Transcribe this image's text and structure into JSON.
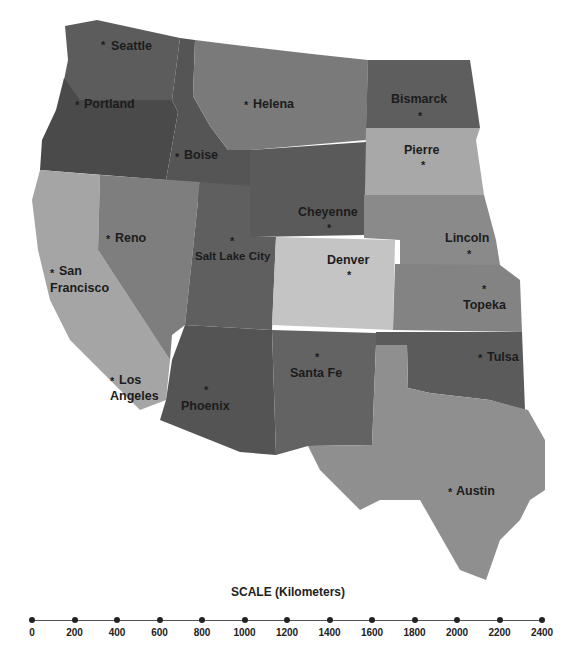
{
  "map": {
    "type": "choropleth-style reference map (grayscale)",
    "region": "Western United States",
    "colors": {
      "washington": "#5c5c5c",
      "oregon": "#4a4a4a",
      "idaho": "#555555",
      "montana": "#7a7a7a",
      "north_dakota": "#5e5e5e",
      "south_dakota": "#a8a8a8",
      "wyoming": "#5a5a5a",
      "nebraska": "#8a8a8a",
      "california": "#a5a5a5",
      "nevada": "#7e7e7e",
      "utah": "#5f5f5f",
      "colorado": "#c4c4c4",
      "kansas": "#838383",
      "arizona": "#545454",
      "new_mexico": "#636363",
      "oklahoma": "#5b5b5b",
      "texas": "#8f8f8f"
    },
    "cities": [
      {
        "name": "Seattle"
      },
      {
        "name": "Portland"
      },
      {
        "name": "Helena"
      },
      {
        "name": "Bismarck"
      },
      {
        "name": "Boise"
      },
      {
        "name": "Pierre"
      },
      {
        "name": "Cheyenne"
      },
      {
        "name": "Reno"
      },
      {
        "name": "Salt Lake City"
      },
      {
        "name": "Lincoln"
      },
      {
        "name": "San"
      },
      {
        "name": "Francisco"
      },
      {
        "name": "Denver"
      },
      {
        "name": "Topeka"
      },
      {
        "name": "Tulsa"
      },
      {
        "name": "Santa Fe"
      },
      {
        "name": "Los"
      },
      {
        "name": "Angeles"
      },
      {
        "name": "Phoenix"
      },
      {
        "name": "Austin"
      }
    ]
  },
  "scale": {
    "title": "SCALE (Kilometers)",
    "ticks": [
      "0",
      "200",
      "400",
      "600",
      "800",
      "1000",
      "1200",
      "1400",
      "1600",
      "1800",
      "2000",
      "2200",
      "2400"
    ]
  }
}
